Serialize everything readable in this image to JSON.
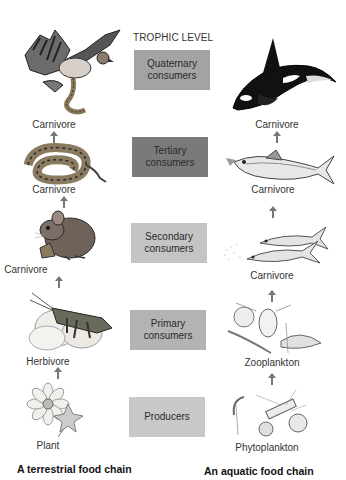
{
  "header": {
    "trophic_level_title": "TROPHIC LEVEL"
  },
  "levels": [
    {
      "line1": "Quaternary",
      "line2": "consumers",
      "color": "#a3a3a3"
    },
    {
      "line1": "Tertiary",
      "line2": "consumers",
      "color": "#7a7a7a"
    },
    {
      "line1": "Secondary",
      "line2": "consumers",
      "color": "#c4c4c4"
    },
    {
      "line1": "Primary",
      "line2": "consumers",
      "color": "#b3b3b3"
    },
    {
      "line1": "Producers",
      "line2": "",
      "color": "#c8c8c8"
    }
  ],
  "terrestrial": {
    "title": "A terrestrial food chain",
    "organisms": [
      {
        "label": "Carnivore",
        "icon": "hawk-icon"
      },
      {
        "label": "Carnivore",
        "icon": "snake-icon"
      },
      {
        "label": "Carnivore",
        "icon": "mouse-icon"
      },
      {
        "label": "Herbivore",
        "icon": "grasshopper-icon"
      },
      {
        "label": "Plant",
        "icon": "flower-icon"
      }
    ]
  },
  "aquatic": {
    "title": "An aquatic food chain",
    "organisms": [
      {
        "label": "Carnivore",
        "icon": "orca-icon"
      },
      {
        "label": "Carnivore",
        "icon": "tuna-icon"
      },
      {
        "label": "Carnivore",
        "icon": "small-fish-icon"
      },
      {
        "label": "Zooplankton",
        "icon": "zooplankton-icon"
      },
      {
        "label": "Phytoplankton",
        "icon": "phytoplankton-icon"
      }
    ]
  }
}
